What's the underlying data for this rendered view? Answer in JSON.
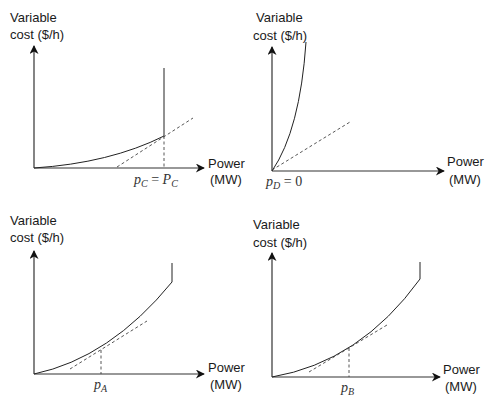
{
  "figure": {
    "panels": [
      {
        "id": "C",
        "y_label_line1": "Variable",
        "y_label_line2": "cost ($/h)",
        "x_label_line1": "Power",
        "x_label_line2": "(MW)",
        "point_var": "p",
        "point_sub": "C",
        "point_eq": " = ",
        "point_rhs": "P",
        "point_rhs_sub": "C",
        "description": "Convex cost curve up to capacity P_C; optimum at upper limit, tangent slope below marginal cost"
      },
      {
        "id": "D",
        "y_label_line1": "Variable",
        "y_label_line2": "cost ($/h)",
        "x_label_line1": "Power",
        "x_label_line2": "(MW)",
        "point_var": "p",
        "point_sub": "D",
        "point_eq": " = ",
        "point_rhs": "0",
        "description": "Steep cost curve; optimum at zero output, dashed line slope below curve slope at origin"
      },
      {
        "id": "A",
        "y_label_line1": "Variable",
        "y_label_line2": "cost ($/h)",
        "x_label_line1": "Power",
        "x_label_line2": "(MW)",
        "point_var": "p",
        "point_sub": "A",
        "description": "Convex cost curve with interior optimum where dashed tangent touches curve"
      },
      {
        "id": "B",
        "y_label_line1": "Variable",
        "y_label_line2": "cost ($/h)",
        "x_label_line1": "Power",
        "x_label_line2": "(MW)",
        "point_var": "p",
        "point_sub": "B",
        "description": "Convex cost curve with interior optimum where dashed tangent touches curve"
      }
    ]
  }
}
